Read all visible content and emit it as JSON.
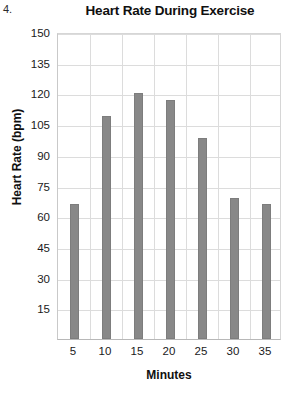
{
  "item_number": "4.",
  "chart_data": {
    "type": "bar",
    "title": "Heart Rate During Exercise",
    "xlabel": "Minutes",
    "ylabel": "Heart Rate (bpm)",
    "categories": [
      "5",
      "10",
      "15",
      "20",
      "25",
      "30",
      "35"
    ],
    "values": [
      66,
      109,
      120,
      117,
      98,
      69,
      66
    ],
    "ylim": [
      0,
      150
    ],
    "yticks": [
      15,
      30,
      45,
      60,
      75,
      90,
      105,
      120,
      135,
      150
    ],
    "ytick_labels": [
      "15",
      "30",
      "45",
      "60",
      "75",
      "90",
      "105",
      "120",
      "135",
      "150"
    ],
    "grid": true,
    "legend": "none",
    "bar_color": "#888888",
    "grid_color": "#dcdcdc",
    "axis_color": "#b8b8b8"
  }
}
